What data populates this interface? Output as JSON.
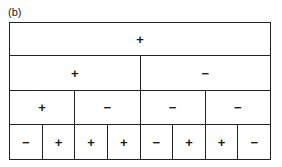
{
  "figure_label": "(b)",
  "tree": {
    "level0": [
      "+"
    ],
    "level1": [
      "+",
      "−"
    ],
    "level2": [
      "+",
      "−",
      "−",
      "−"
    ],
    "level3": [
      "−",
      "+",
      "+",
      "+",
      "−",
      "+",
      "+",
      "−"
    ]
  }
}
